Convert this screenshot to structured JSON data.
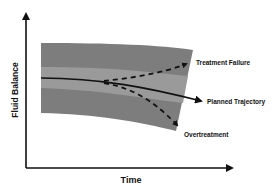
{
  "diagram": {
    "axes": {
      "x_label": "Time",
      "y_label": "Fluid Balance"
    },
    "trajectories": [
      {
        "name": "Treatment Failure",
        "style": "dashed"
      },
      {
        "name": "Planned Trajectory",
        "style": "solid"
      },
      {
        "name": "Overtreatment",
        "style": "dashed"
      }
    ],
    "colors": {
      "outer_band": "#7d7d7d",
      "inner_band": "#9a9a9a",
      "line": "#111111"
    }
  }
}
